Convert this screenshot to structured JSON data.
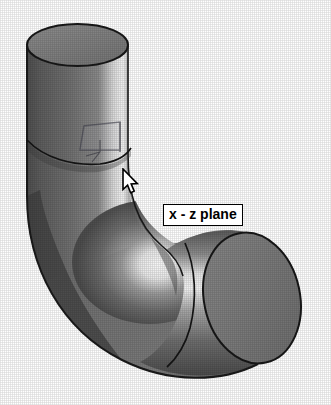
{
  "viewport": {
    "name": "cad-3d-viewport",
    "background_color": "#ffffff"
  },
  "model": {
    "name": "elbow-pipe-90-degree",
    "description": "Shaded 90 degree cylindrical elbow pipe",
    "shading": "grayscale-dithered",
    "colors": {
      "face_mid": "#7d7d7d",
      "face_dark": "#4a4a4a",
      "face_darker": "#3a3a3a",
      "face_light": "#cfcfcf",
      "highlight": "#f5f5f5",
      "edge": "#1a1a1a",
      "end_cap": "#787878",
      "top_cap": "#808080"
    },
    "features": [
      {
        "name": "top-circular-face",
        "type": "cap"
      },
      {
        "name": "vertical-cylinder-arm",
        "type": "cylinder"
      },
      {
        "name": "elbow-bend",
        "type": "torus-sweep"
      },
      {
        "name": "horizontal-cylinder-arm",
        "type": "cylinder"
      },
      {
        "name": "right-circular-face",
        "type": "cap"
      },
      {
        "name": "upper-tangent-seam",
        "type": "edge"
      },
      {
        "name": "lower-tangent-seam",
        "type": "edge"
      }
    ]
  },
  "plane_overlay": {
    "name": "x-z-plane-indicator",
    "label": "x - z plane",
    "visible": true,
    "stroke_color": "#5a5a64",
    "state": "highlighted"
  },
  "tooltip": {
    "text": "x - z plane",
    "background_color": "#ffffff",
    "border_color": "#000000",
    "text_color": "#000000"
  },
  "cursor": {
    "type": "arrow-pointer",
    "fill_color": "#ffffff",
    "outline_color": "#000000",
    "x": 121,
    "y": 168
  }
}
